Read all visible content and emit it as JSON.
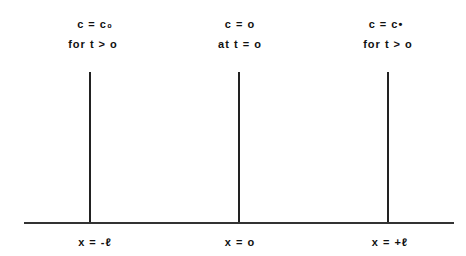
{
  "diagram": {
    "boundaries": [
      {
        "position": "x = -ℓ",
        "condition_top": "c = c₀",
        "condition_bottom": "for  t > o"
      },
      {
        "position": "x = o",
        "condition_top": "c = o",
        "condition_bottom": "at  t = o"
      },
      {
        "position": "x = +ℓ",
        "condition_top": "c = c•",
        "condition_bottom": "for  t > o"
      }
    ]
  }
}
